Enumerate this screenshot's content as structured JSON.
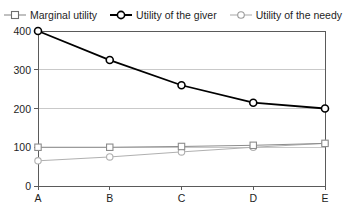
{
  "chart_data": {
    "type": "line",
    "title": "",
    "xlabel": "",
    "ylabel": "",
    "categories": [
      "A",
      "B",
      "C",
      "D",
      "E"
    ],
    "ylim": [
      0,
      400
    ],
    "yticks": [
      0,
      100,
      200,
      300,
      400
    ],
    "ytick_labels": [
      "0",
      "100",
      "200",
      "300",
      "400"
    ],
    "grid": "horizontal",
    "legend_position": "top",
    "series": [
      {
        "name": "Marginal utility",
        "marker": "open-square",
        "color": "#8c8c8c",
        "linewidth": 1,
        "values": [
          100,
          100,
          102,
          105,
          110
        ]
      },
      {
        "name": "Utility of the giver",
        "marker": "open-circle",
        "color": "#000000",
        "linewidth": 1.8,
        "values": [
          400,
          325,
          260,
          215,
          200
        ]
      },
      {
        "name": "Utility of the needy",
        "marker": "open-circle",
        "color": "#b0b0b0",
        "linewidth": 1,
        "values": [
          65,
          75,
          88,
          100,
          110
        ]
      }
    ]
  },
  "legend": {
    "items": [
      {
        "label": "Marginal utility",
        "icon": "legend-square-marker-icon"
      },
      {
        "label": "Utility of the giver",
        "icon": "legend-circle-marker-icon"
      },
      {
        "label": "Utility of the needy",
        "icon": "legend-circle-marker-icon"
      }
    ]
  },
  "axes": {
    "y_tick_labels": [
      "400",
      "300",
      "200",
      "100",
      "0"
    ],
    "x_tick_labels": [
      "A",
      "B",
      "C",
      "D",
      "E"
    ]
  },
  "colors": {
    "background": "#ffffff",
    "axis": "#5a5a5a",
    "grid": "#c9c9c9",
    "series_marginal": "#8c8c8c",
    "series_giver": "#000000",
    "series_needy": "#b0b0b0"
  }
}
